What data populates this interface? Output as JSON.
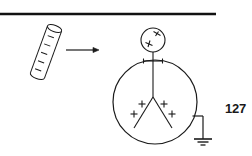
{
  "page": {
    "number": "127",
    "rule": {
      "color": "#111111",
      "x1": 0,
      "x2": 216,
      "y": 14,
      "thickness": 2.4
    }
  },
  "figure": {
    "name": "charged-rod-approaching-grounded-electroscope",
    "ink_color": "#1a1a1a",
    "charged_rod": {
      "label": "charged rod",
      "tilt_degrees": 20,
      "tick_marks": 5,
      "top_ellipse": {
        "cx": 55,
        "cy": 27,
        "rx": 7.5,
        "ry": 3.2
      },
      "bottom_ellipse": {
        "cx": 36,
        "cy": 77,
        "rx": 7.5,
        "ry": 3.2
      }
    },
    "arrow": {
      "label": "motion arrow",
      "x1": 66,
      "x2": 99,
      "y": 50,
      "head_length": 6,
      "head_width": 5
    },
    "electroscope": {
      "knob": {
        "label": "knob",
        "cx": 153,
        "cy": 40,
        "r": 12,
        "charges": [
          {
            "sign": "+",
            "x": 157,
            "y": 35
          },
          {
            "sign": "+",
            "x": 149,
            "y": 43
          }
        ]
      },
      "stem": {
        "x": 153,
        "y1": 52,
        "y2": 97
      },
      "insulator_bar": {
        "x1": 143,
        "x2": 163,
        "y": 61,
        "tick_height": 5
      },
      "body": {
        "label": "electroscope case",
        "cx": 155,
        "cy": 102,
        "r": 42
      },
      "leaves": {
        "label": "gold leaves",
        "apex_x": 153,
        "apex_y": 97,
        "left_tip_x": 134,
        "left_tip_y": 128,
        "right_tip_x": 172,
        "right_tip_y": 128,
        "charges": [
          {
            "sign": "+",
            "x": 142,
            "y": 104
          },
          {
            "sign": "+",
            "x": 164,
            "y": 104
          },
          {
            "sign": "+",
            "x": 134,
            "y": 114
          },
          {
            "sign": "+",
            "x": 172,
            "y": 114
          }
        ]
      },
      "ground": {
        "label": "earth ground",
        "contact_x": 192,
        "contact_y": 116,
        "corner_x": 203,
        "corner_y": 116,
        "post_y2": 139,
        "bars": [
          {
            "half_width": 9,
            "y": 139
          },
          {
            "half_width": 5.5,
            "y": 142
          },
          {
            "half_width": 2.5,
            "y": 145
          }
        ]
      }
    }
  }
}
